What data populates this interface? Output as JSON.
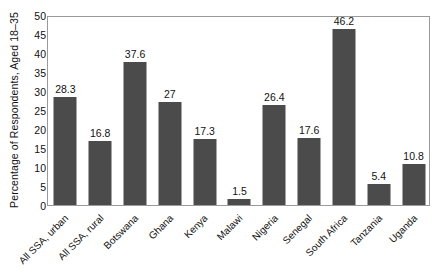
{
  "chart_data": {
    "type": "bar",
    "title": "",
    "subtitle": "",
    "xlabel": "",
    "ylabel": "Percentage of Respondents, Aged 18–35",
    "ylim": [
      0,
      50
    ],
    "ytick_step": 5,
    "yticks": [
      "50",
      "45",
      "40",
      "35",
      "30",
      "25",
      "20",
      "15",
      "10",
      "5",
      "0"
    ],
    "grid": false,
    "legend": false,
    "legend_position": "none",
    "bar_color": "#4b4b4b",
    "axis_color": "#9a9a9a",
    "background_color": "#ffffff",
    "xtick_rotation_deg": -45,
    "categories": [
      "All SSA, urban",
      "All SSA, rural",
      "Botswana",
      "Ghana",
      "Kenya",
      "Malawi",
      "Nigeria",
      "Senegal",
      "South Africa",
      "Tanzania",
      "Uganda"
    ],
    "values": [
      28.3,
      16.8,
      37.6,
      27,
      17.3,
      1.5,
      26.4,
      17.6,
      46.2,
      5.4,
      10.8
    ],
    "value_labels": [
      "28.3",
      "16.8",
      "37.6",
      "27",
      "17.3",
      "1.5",
      "26.4",
      "17.6",
      "46.2",
      "5.4",
      "10.8"
    ]
  }
}
